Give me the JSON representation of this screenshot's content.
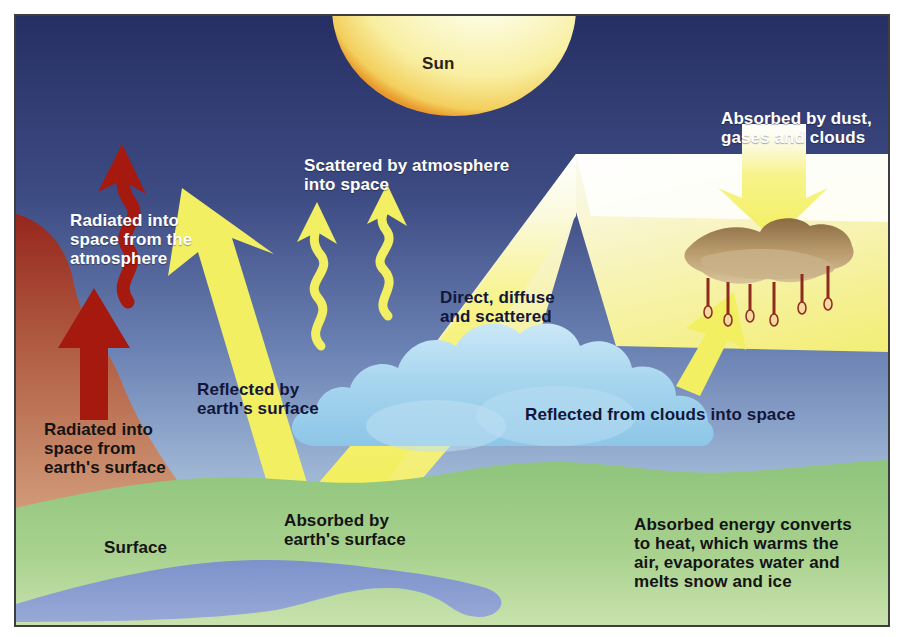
{
  "figure": {
    "top_caption": "",
    "frame_border_color": "#3d3d3d"
  },
  "colors": {
    "sky_top": "#2b3468",
    "sky_bottom": "#b8cbe2",
    "sun_core": "#fdfbe2",
    "sun_edge": "#f2c14a",
    "sun_rim": "#e9962c",
    "beam_yellow": "#f4ef63",
    "arrow_yellow": "#f2ef62",
    "land_green": "#8fc47d",
    "land_green_light": "#c3dda4",
    "water_blue": "#6f86c4",
    "cloud_blue": "#a9d6ef",
    "cloud_blue_dark": "#7ab8e0",
    "red_radiation": "#a31a14",
    "red_terrain": "#b4604a",
    "dust_brown": "#9a7a4f",
    "text_white": "#ffffff",
    "text_dark": "#12173a",
    "text_black": "#141414"
  },
  "labels": {
    "sun": "Sun",
    "absorbed_by_dust": "Absorbed by dust,\ngases and clouds",
    "scattered_by_atmosphere": "Scattered by atmosphere\ninto space",
    "radiated_from_atmosphere": "Radiated into\nspace from the\natmosphere",
    "direct_diffuse_scattered": "Direct, diffuse\nand scattered",
    "reflected_by_surface": "Reflected by\nearth's surface",
    "radiated_from_surface": "Radiated into\nspace from\nearth's surface",
    "reflected_from_clouds": "Reflected from clouds into space",
    "surface": "Surface",
    "absorbed_by_surface": "Absorbed by\nearth's surface",
    "absorbed_energy_converts": "Absorbed energy converts\nto heat, which warms the\nair, evaporates water and\nmelts snow and ice"
  },
  "elements": {
    "sun": "sun-disc",
    "solar_beam": "direct-solar-beam",
    "scatter_squiggles": 2,
    "reflected_arrow": "reflected-surface-arrow",
    "cloud_reflect_arrow": "cloud-reflection-arrow",
    "dust_absorb_arrow": "dust-absorption-arrow",
    "red_wavy_arrow": "atmospheric-radiation-arrow",
    "red_straight_arrow": "surface-radiation-arrow",
    "cloud": "cumulus-cloud",
    "dust_cloud": "dust-cloud-with-rain",
    "rain_drops": 6,
    "water_body": "lake"
  }
}
